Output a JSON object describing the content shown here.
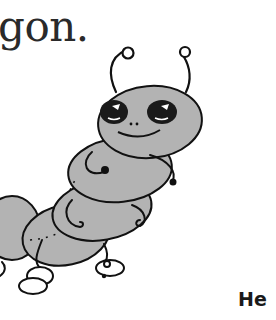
{
  "page": {
    "top_text": "gon.",
    "bottom_text": "He"
  },
  "illustration": {
    "subject": "caterpillar-cartoon",
    "body_color": "#b3b3b3",
    "outline_color": "#111111"
  }
}
